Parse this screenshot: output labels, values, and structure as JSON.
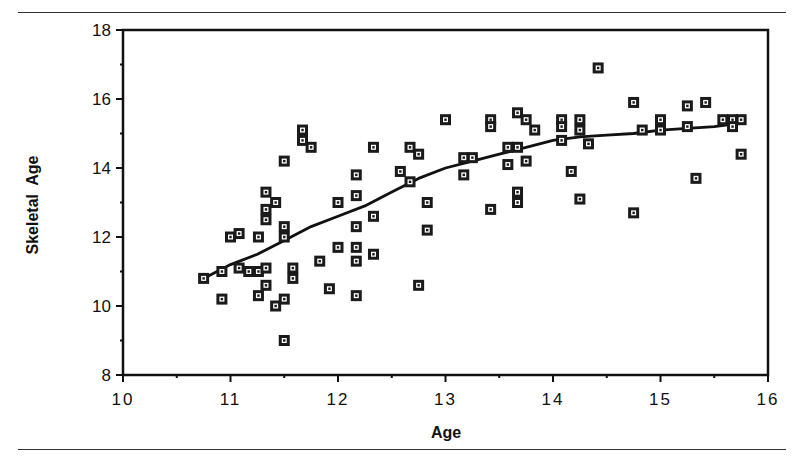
{
  "chart_data": {
    "type": "scatter",
    "title": "",
    "xlabel": "Age",
    "ylabel": "Skeletal  Age",
    "xlim": [
      10,
      16
    ],
    "ylim": [
      8,
      18
    ],
    "x_ticks": [
      "10",
      "11",
      "12",
      "13",
      "14",
      "15",
      "16"
    ],
    "y_ticks": [
      "8",
      "10",
      "12",
      "14",
      "16",
      "18"
    ],
    "grid": false,
    "legend": null,
    "marker": "square with inner dot",
    "points": [
      [
        10.75,
        10.8
      ],
      [
        10.92,
        11.0
      ],
      [
        10.92,
        10.2
      ],
      [
        11.0,
        12.0
      ],
      [
        11.08,
        12.1
      ],
      [
        11.08,
        11.1
      ],
      [
        11.17,
        11.0
      ],
      [
        11.26,
        12.0
      ],
      [
        11.26,
        11.0
      ],
      [
        11.26,
        10.3
      ],
      [
        11.33,
        11.1
      ],
      [
        11.33,
        10.6
      ],
      [
        11.33,
        13.3
      ],
      [
        11.33,
        12.8
      ],
      [
        11.33,
        12.5
      ],
      [
        11.42,
        13.0
      ],
      [
        11.42,
        10.0
      ],
      [
        11.5,
        14.2
      ],
      [
        11.5,
        12.3
      ],
      [
        11.5,
        12.0
      ],
      [
        11.5,
        10.2
      ],
      [
        11.5,
        9.0
      ],
      [
        11.58,
        11.1
      ],
      [
        11.58,
        10.8
      ],
      [
        11.67,
        15.1
      ],
      [
        11.67,
        14.8
      ],
      [
        11.75,
        14.6
      ],
      [
        11.83,
        11.3
      ],
      [
        11.92,
        10.5
      ],
      [
        12.0,
        13.0
      ],
      [
        12.0,
        11.7
      ],
      [
        12.17,
        13.8
      ],
      [
        12.17,
        13.2
      ],
      [
        12.17,
        12.3
      ],
      [
        12.17,
        11.7
      ],
      [
        12.17,
        11.3
      ],
      [
        12.17,
        10.3
      ],
      [
        12.33,
        14.6
      ],
      [
        12.33,
        12.6
      ],
      [
        12.33,
        11.5
      ],
      [
        12.58,
        13.9
      ],
      [
        12.67,
        14.6
      ],
      [
        12.67,
        13.6
      ],
      [
        12.75,
        14.4
      ],
      [
        12.75,
        10.6
      ],
      [
        12.83,
        13.0
      ],
      [
        12.83,
        12.2
      ],
      [
        13.0,
        15.4
      ],
      [
        13.17,
        14.3
      ],
      [
        13.17,
        13.8
      ],
      [
        13.25,
        14.3
      ],
      [
        13.42,
        15.4
      ],
      [
        13.42,
        15.2
      ],
      [
        13.42,
        12.8
      ],
      [
        13.58,
        14.6
      ],
      [
        13.58,
        14.1
      ],
      [
        13.67,
        15.6
      ],
      [
        13.67,
        14.6
      ],
      [
        13.67,
        13.3
      ],
      [
        13.67,
        13.0
      ],
      [
        13.75,
        15.4
      ],
      [
        13.75,
        14.2
      ],
      [
        13.83,
        15.1
      ],
      [
        14.08,
        15.4
      ],
      [
        14.08,
        15.2
      ],
      [
        14.08,
        14.8
      ],
      [
        14.17,
        13.9
      ],
      [
        14.25,
        15.4
      ],
      [
        14.25,
        15.1
      ],
      [
        14.25,
        13.1
      ],
      [
        14.33,
        14.7
      ],
      [
        14.42,
        16.9
      ],
      [
        14.75,
        15.9
      ],
      [
        14.75,
        12.7
      ],
      [
        14.83,
        15.1
      ],
      [
        15.0,
        15.4
      ],
      [
        15.0,
        15.1
      ],
      [
        15.25,
        15.8
      ],
      [
        15.25,
        15.2
      ],
      [
        15.33,
        13.7
      ],
      [
        15.42,
        15.9
      ],
      [
        15.58,
        15.4
      ],
      [
        15.67,
        15.4
      ],
      [
        15.67,
        15.2
      ],
      [
        15.75,
        15.4
      ],
      [
        15.75,
        14.4
      ]
    ],
    "trend_line": {
      "type": "smoothed curve",
      "x": [
        10.75,
        11.0,
        11.25,
        11.5,
        11.75,
        12.0,
        12.25,
        12.5,
        12.75,
        13.0,
        13.25,
        13.5,
        13.75,
        14.0,
        14.25,
        14.5,
        14.75,
        15.0,
        15.25,
        15.5,
        15.75
      ],
      "y": [
        10.8,
        11.2,
        11.5,
        11.9,
        12.3,
        12.6,
        12.9,
        13.3,
        13.7,
        14.0,
        14.2,
        14.4,
        14.6,
        14.8,
        14.9,
        14.95,
        15.0,
        15.1,
        15.15,
        15.2,
        15.3
      ]
    }
  },
  "axes": {
    "x_label": "Age",
    "y_label": "Skeletal  Age",
    "x_ticks": [
      "10",
      "11",
      "12",
      "13",
      "14",
      "15",
      "16"
    ],
    "y_ticks": [
      "8",
      "10",
      "12",
      "14",
      "16",
      "18"
    ]
  }
}
